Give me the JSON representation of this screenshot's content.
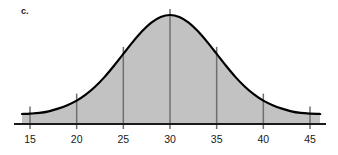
{
  "figure": {
    "part_label": "c.",
    "caption": "",
    "background_color": "#ffffff"
  },
  "chart_data": {
    "type": "area",
    "title": "",
    "subtitle": "",
    "xlabel": "",
    "ylabel": "",
    "distribution": "normal",
    "mean": 30,
    "std_dev": 5,
    "xlim": [
      13,
      47
    ],
    "ylim": [
      0,
      1
    ],
    "grid": false,
    "legend": null,
    "axis_line_color": "#1a1a1a",
    "curve_color": "#000000",
    "fill_color": "#c2c2c2",
    "tick_line_color": "#6f6f6f",
    "x_ticks": [
      15,
      20,
      25,
      30,
      35,
      40,
      45
    ],
    "x_tick_labels": [
      "15",
      "20",
      "25",
      "30",
      "35",
      "40",
      "45"
    ],
    "curve_points": [
      {
        "x": 14.0,
        "y": 0.001
      },
      {
        "x": 15.0,
        "y": 0.004
      },
      {
        "x": 16.0,
        "y": 0.011
      },
      {
        "x": 17.0,
        "y": 0.027
      },
      {
        "x": 18.0,
        "y": 0.054
      },
      {
        "x": 19.0,
        "y": 0.089
      },
      {
        "x": 20.0,
        "y": 0.135
      },
      {
        "x": 21.0,
        "y": 0.198
      },
      {
        "x": 22.0,
        "y": 0.278
      },
      {
        "x": 23.0,
        "y": 0.375
      },
      {
        "x": 24.0,
        "y": 0.487
      },
      {
        "x": 25.0,
        "y": 0.607
      },
      {
        "x": 26.0,
        "y": 0.726
      },
      {
        "x": 27.0,
        "y": 0.835
      },
      {
        "x": 28.0,
        "y": 0.923
      },
      {
        "x": 29.0,
        "y": 0.98
      },
      {
        "x": 30.0,
        "y": 1.0
      },
      {
        "x": 31.0,
        "y": 0.98
      },
      {
        "x": 32.0,
        "y": 0.923
      },
      {
        "x": 33.0,
        "y": 0.835
      },
      {
        "x": 34.0,
        "y": 0.726
      },
      {
        "x": 35.0,
        "y": 0.607
      },
      {
        "x": 36.0,
        "y": 0.487
      },
      {
        "x": 37.0,
        "y": 0.375
      },
      {
        "x": 38.0,
        "y": 0.278
      },
      {
        "x": 39.0,
        "y": 0.198
      },
      {
        "x": 40.0,
        "y": 0.135
      },
      {
        "x": 41.0,
        "y": 0.089
      },
      {
        "x": 42.0,
        "y": 0.054
      },
      {
        "x": 43.0,
        "y": 0.027
      },
      {
        "x": 44.0,
        "y": 0.011
      },
      {
        "x": 45.0,
        "y": 0.004
      },
      {
        "x": 46.0,
        "y": 0.001
      }
    ]
  }
}
